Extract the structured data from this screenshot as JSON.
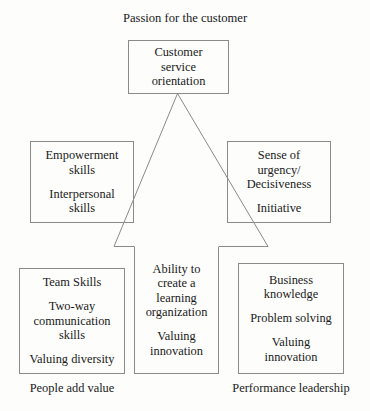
{
  "diagram": {
    "title_top": "Passion for the customer",
    "caption_bottom_left": "People add value",
    "caption_bottom_right": "Performance leadership",
    "stroke_color": "#8a8a8a",
    "text_color": "#1a1a1a",
    "background_color": "#fdfdfc"
  },
  "nodes": {
    "top": {
      "name": "customer-service-orientation",
      "groups": [
        {
          "lines": [
            "Customer",
            "service",
            "orientation"
          ]
        }
      ]
    },
    "mid_left": {
      "name": "empowerment-interpersonal",
      "groups": [
        {
          "lines": [
            "Empowerment",
            "skills"
          ]
        },
        {
          "lines": [
            "Interpersonal",
            "skills"
          ]
        }
      ]
    },
    "mid_right": {
      "name": "urgency-initiative",
      "groups": [
        {
          "lines": [
            "Sense of",
            "urgency/",
            "Decisiveness"
          ]
        },
        {
          "lines": [
            "Initiative"
          ]
        }
      ]
    },
    "bottom_left": {
      "name": "team-skills",
      "groups": [
        {
          "lines": [
            "Team Skills"
          ]
        },
        {
          "lines": [
            "Two-way",
            "communication",
            "skills"
          ]
        },
        {
          "lines": [
            "Valuing diversity"
          ]
        }
      ]
    },
    "center": {
      "name": "learning-organization",
      "groups": [
        {
          "lines": [
            "Ability to",
            "create a",
            "learning",
            "organization"
          ]
        },
        {
          "lines": [
            "Valuing",
            "innovation"
          ]
        }
      ]
    },
    "bottom_right": {
      "name": "business-knowledge",
      "groups": [
        {
          "lines": [
            "Business",
            "knowledge"
          ]
        },
        {
          "lines": [
            "Problem solving"
          ]
        },
        {
          "lines": [
            "Valuing",
            "innovation"
          ]
        }
      ]
    }
  }
}
